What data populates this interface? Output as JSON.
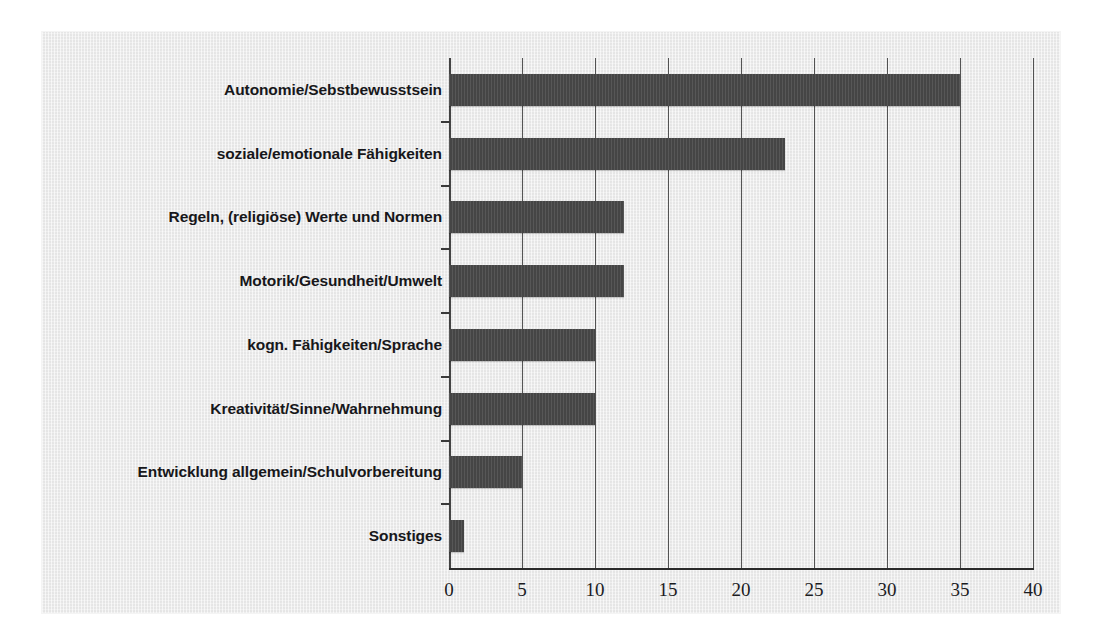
{
  "chart_data": {
    "type": "bar",
    "orientation": "horizontal",
    "title": "",
    "subtitle": "",
    "xlabel": "",
    "ylabel": "",
    "categories": [
      "Autonomie/Sebstbewusstsein",
      "soziale/emotionale Fähigkeiten",
      "Regeln, (religiöse) Werte und Normen",
      "Motorik/Gesundheit/Umwelt",
      "kogn. Fähigkeiten/Sprache",
      "Kreativität/Sinne/Wahrnehmung",
      "Entwicklung allgemein/Schulvorbereitung",
      "Sonstiges"
    ],
    "values": [
      35,
      23,
      12,
      12,
      10,
      10,
      5,
      1
    ],
    "xlim": [
      0,
      40
    ],
    "xticks": [
      0,
      5,
      10,
      15,
      20,
      25,
      30,
      35,
      40
    ],
    "xtick_labels": [
      "0",
      "5",
      "10",
      "15",
      "20",
      "25",
      "30",
      "35",
      "40"
    ],
    "grid": "vertical",
    "legend": null,
    "bar_color": "#4a4a4a",
    "axis_color": "#2b2b2b",
    "panel_background": "#ebebeb",
    "label_color": "#17171a"
  }
}
